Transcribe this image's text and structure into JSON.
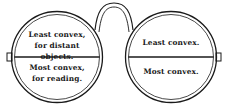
{
  "figure": {
    "colors": {
      "ink": "#1a1a1a",
      "background": "#ffffff"
    },
    "left_lens": {
      "upper_label": [
        "Least convex,",
        "for distant objects."
      ],
      "lower_label": [
        "Most convex,",
        "for reading."
      ]
    },
    "right_lens": {
      "upper_label": [
        "Least convex."
      ],
      "lower_label": [
        "Most convex."
      ]
    }
  }
}
